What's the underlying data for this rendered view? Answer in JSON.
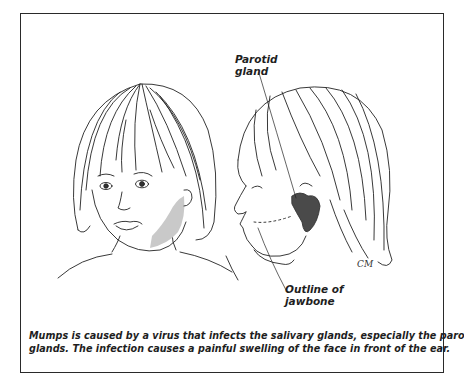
{
  "figure": {
    "labels": {
      "parotid_gland": [
        "Parotid",
        "gland"
      ],
      "jawbone_outline": [
        "Outline of",
        "jawbone"
      ]
    },
    "signature": "CM",
    "caption": {
      "line1": "Mumps is caused by a virus that infects the salivary glands, especially the parotid",
      "line2": "glands. The infection causes a painful swelling of the face in front of the ear."
    },
    "colors": {
      "frame": "#2a2a2a",
      "ink": "#1e1e1e",
      "swelling_shade": "#c8c8c8",
      "parotid_fill": "#4a4a4a"
    }
  }
}
